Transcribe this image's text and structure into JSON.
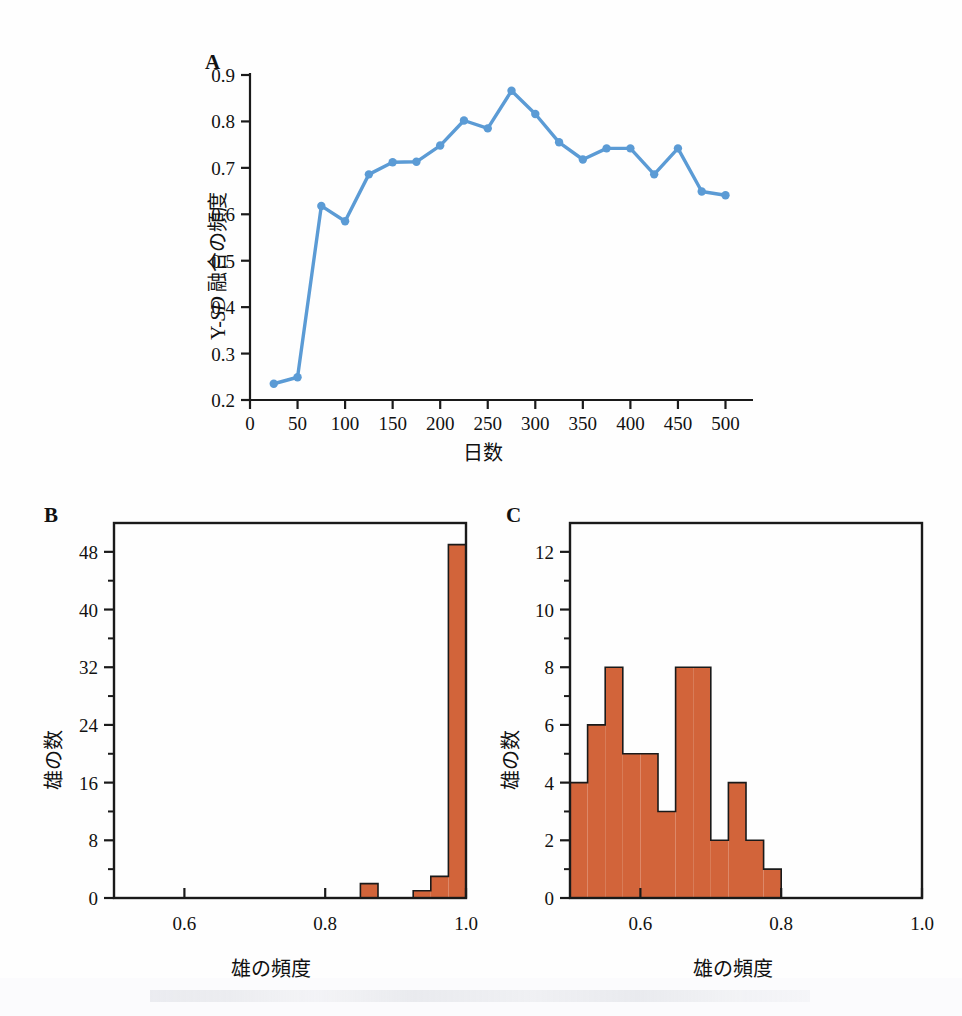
{
  "figure": {
    "background_color": "#fefefe",
    "line_color": "#5B9BD5",
    "bar_fill_color": "#D2643A",
    "bar_edge_color": "#1a1a1a",
    "axis_color": "#1a1a1a"
  },
  "panelA": {
    "letter": "A",
    "ylabel_prefix": "Y-",
    "ylabel_italic": "SD",
    "ylabel_suffix": " 融合の頻度",
    "ylabel_full": "Y-SD 融合の頻度",
    "xlabel": "日数",
    "y_ticks": [
      "0.2",
      "0.3",
      "0.4",
      "0.5",
      "0.6",
      "0.7",
      "0.8",
      "0.9"
    ],
    "x_ticks": [
      "0",
      "50",
      "100",
      "150",
      "200",
      "250",
      "300",
      "350",
      "400",
      "450",
      "500"
    ]
  },
  "panelB": {
    "letter": "B",
    "ylabel": "雄の数",
    "xlabel": "雄の頻度",
    "y_ticks": [
      "0",
      "8",
      "16",
      "24",
      "32",
      "40",
      "48"
    ],
    "x_ticks": [
      "0.6",
      "0.8",
      "1.0"
    ]
  },
  "panelC": {
    "letter": "C",
    "ylabel": "雄の数",
    "xlabel": "雄の頻度",
    "y_ticks": [
      "0",
      "2",
      "4",
      "6",
      "8",
      "10",
      "12"
    ],
    "x_ticks": [
      "0.6",
      "0.8",
      "1.0"
    ]
  },
  "chart_data": [
    {
      "type": "line",
      "panel": "A",
      "title": "",
      "xlabel": "日数",
      "ylabel": "Y-SD 融合の頻度",
      "xlim": [
        0,
        510
      ],
      "ylim": [
        0.2,
        0.9
      ],
      "grid": false,
      "legend": "none",
      "marker": "circle",
      "x": [
        25,
        50,
        75,
        100,
        125,
        150,
        175,
        200,
        225,
        250,
        275,
        300,
        325,
        350,
        375,
        400,
        425,
        450,
        475,
        500
      ],
      "y": [
        0.235,
        0.249,
        0.618,
        0.585,
        0.686,
        0.712,
        0.713,
        0.748,
        0.802,
        0.785,
        0.866,
        0.816,
        0.755,
        0.718,
        0.742,
        0.742,
        0.686,
        0.742,
        0.649,
        0.641
      ]
    },
    {
      "type": "bar",
      "panel": "B",
      "title": "",
      "xlabel": "雄の頻度",
      "ylabel": "雄の数",
      "xlim": [
        0.5,
        1.0
      ],
      "ylim": [
        0,
        52
      ],
      "grid": false,
      "legend": "none",
      "bin_width": 0.025,
      "bin_starts": [
        0.5,
        0.525,
        0.55,
        0.575,
        0.6,
        0.625,
        0.65,
        0.675,
        0.7,
        0.725,
        0.75,
        0.775,
        0.8,
        0.825,
        0.85,
        0.875,
        0.9,
        0.925,
        0.95,
        0.975
      ],
      "values": [
        0,
        0,
        0,
        0,
        0,
        0,
        0,
        0,
        0,
        0,
        0,
        0,
        0,
        0,
        2,
        0,
        0,
        1,
        3,
        49
      ]
    },
    {
      "type": "bar",
      "panel": "C",
      "title": "",
      "xlabel": "雄の頻度",
      "ylabel": "雄の数",
      "xlim": [
        0.5,
        1.0
      ],
      "ylim": [
        0,
        13
      ],
      "grid": false,
      "legend": "none",
      "bin_width": 0.025,
      "bin_starts": [
        0.5,
        0.525,
        0.55,
        0.575,
        0.6,
        0.625,
        0.65,
        0.675,
        0.7,
        0.725,
        0.75,
        0.775,
        0.8,
        0.825,
        0.85,
        0.875,
        0.9,
        0.925,
        0.95,
        0.975
      ],
      "values": [
        4,
        6,
        8,
        5,
        5,
        3,
        8,
        8,
        2,
        4,
        2,
        1,
        0,
        0,
        0,
        0,
        0,
        0,
        0,
        0
      ]
    }
  ]
}
